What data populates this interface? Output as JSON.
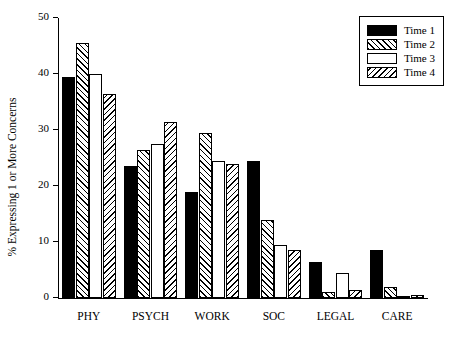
{
  "chart_data": {
    "type": "bar",
    "title": "",
    "xlabel": "",
    "ylabel": "% Expressing 1 or More Concerns",
    "ylim": [
      0,
      50
    ],
    "yticks": [
      0,
      10,
      20,
      30,
      40,
      50
    ],
    "ytick_labels": [
      "0",
      "10",
      "20",
      "30",
      "40",
      "50"
    ],
    "grid": false,
    "legend_position": "top-right",
    "categories": [
      "PHY",
      "PSYCH",
      "WORK",
      "SOC",
      "LEGAL",
      "CARE"
    ],
    "series": [
      {
        "name": "Time 1",
        "fill": "solid",
        "values": [
          39.5,
          23.5,
          19.0,
          24.5,
          6.5,
          8.5
        ]
      },
      {
        "name": "Time 2",
        "fill": "hatch-fwd",
        "values": [
          45.5,
          26.5,
          29.5,
          14.0,
          1.0,
          2.0
        ]
      },
      {
        "name": "Time 3",
        "fill": "white",
        "values": [
          40.0,
          27.5,
          24.5,
          9.5,
          4.5,
          0.3
        ]
      },
      {
        "name": "Time 4",
        "fill": "hatch-back",
        "values": [
          36.5,
          31.5,
          24.0,
          8.5,
          1.5,
          0.5
        ]
      }
    ]
  },
  "legend": {
    "items": [
      {
        "label": "Time 1"
      },
      {
        "label": "Time 2"
      },
      {
        "label": "Time 3"
      },
      {
        "label": "Time 4"
      }
    ]
  },
  "colors": {
    "axis": "#000000",
    "background": "#ffffff",
    "bar_solid": "#000000",
    "bar_white": "#ffffff"
  }
}
